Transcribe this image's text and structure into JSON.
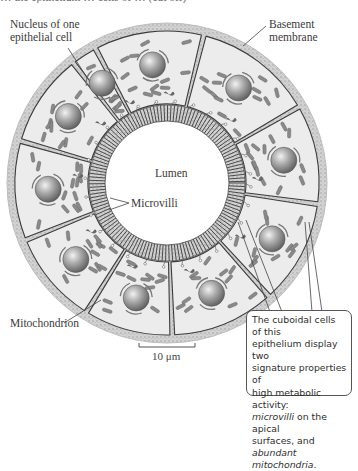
{
  "figure": {
    "cropped_top_text": "… the epithelium … cells of … (cut off)",
    "labels": {
      "nucleus": [
        "Nucleus of one",
        "epithelial cell"
      ],
      "basement_membrane": [
        "Basement",
        "membrane"
      ],
      "lumen": "Lumen",
      "microvilli": "Microvilli",
      "mitochondrion": "Mitochondrion",
      "scale_bar": "10 μm"
    },
    "callout": {
      "line1": "The cuboidal cells of this",
      "line2": "epithelium display two",
      "line3": "signature properties of",
      "line4": "high metabolic activity:",
      "line5_italic": "microvilli",
      "line5_rest": " on the apical",
      "line6_rest": "surfaces, and ",
      "line6_italic": "abundant",
      "line7_italic": "mitochondria",
      "line7_rest": "."
    },
    "geometry": {
      "center": [
        167,
        183
      ],
      "outer_radius": 160,
      "membrane_width": 8,
      "apical_radius": 78,
      "lumen_radius": 62,
      "cell_count": 10,
      "cell_boundary_angles_deg": [
        -118,
        -76,
        -30,
        8,
        48,
        88,
        122,
        158,
        196,
        232
      ]
    },
    "colors": {
      "membrane": "#c9c9c9",
      "cytoplasm": "#ececec",
      "cell_border": "#3c3c3c",
      "nucleus_light": "#e6e6e6",
      "nucleus_dark": "#6e6e6e",
      "mitochondrion": "#8a8a8a",
      "microvilli": "#4a4a4a",
      "leader_line": "#444444"
    }
  }
}
